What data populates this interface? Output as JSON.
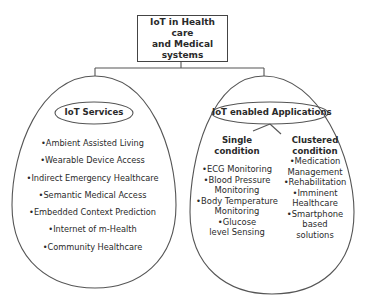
{
  "root": {
    "lines": [
      "IoT in Health care",
      "and Medical",
      "systems"
    ]
  },
  "services": {
    "title": "IoT Services",
    "items": [
      "•Ambient Assisted Living",
      "•Wearable Device Access",
      "•Indirect Emergency Healthcare",
      "•Semantic Medical Access",
      "•Embedded Context Prediction",
      "•Internet of m-Health",
      "•Community Healthcare"
    ]
  },
  "applications": {
    "title": "IoT enabled Applications",
    "single": {
      "heading": [
        "Single",
        "condition"
      ],
      "items": [
        "•ECG Monitoring",
        "•Blood Pressure",
        "Monitoring",
        "•Body Temperature",
        "Monitoring",
        "•Glucose",
        "level Sensing"
      ]
    },
    "clustered": {
      "heading": [
        "Clustered",
        "condition"
      ],
      "items": [
        "•Medication",
        "Management",
        "•Rehabilitation",
        "•Imminent",
        "Healthcare",
        "•Smartphone",
        "based",
        "solutions"
      ]
    }
  },
  "colors": {
    "stroke": "#444444",
    "text": "#2a2a2a",
    "background": "#ffffff"
  }
}
